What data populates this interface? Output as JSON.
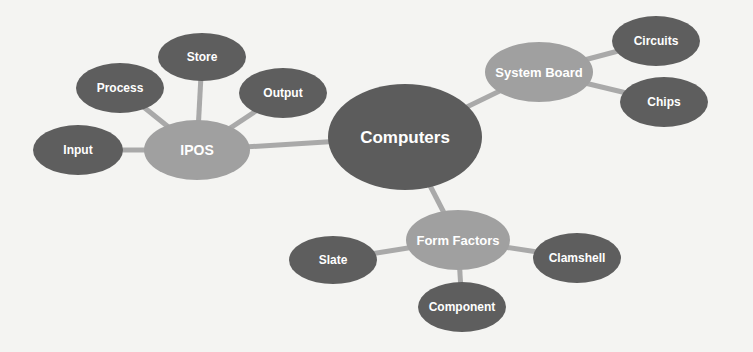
{
  "diagram": {
    "type": "mind-map",
    "colors": {
      "background": "#f4f4f2",
      "root_fill": "#5c5c5c",
      "branch_fill": "#a0a0a0",
      "leaf_fill": "#5e5e5e",
      "connector": "#a9a9a9",
      "label": "#ffffff"
    },
    "root": {
      "label": "Computers",
      "cx": 405,
      "cy": 137,
      "rx": 77,
      "ry": 53,
      "font_size": 17
    },
    "branches": [
      {
        "label": "IPOS",
        "cx": 197,
        "cy": 150,
        "rx": 53,
        "ry": 30,
        "font_size": 14,
        "children": [
          {
            "label": "Input",
            "cx": 78,
            "cy": 150,
            "rx": 45,
            "ry": 25
          },
          {
            "label": "Process",
            "cx": 120,
            "cy": 88,
            "rx": 44,
            "ry": 25
          },
          {
            "label": "Store",
            "cx": 202,
            "cy": 57,
            "rx": 44,
            "ry": 24
          },
          {
            "label": "Output",
            "cx": 283,
            "cy": 93,
            "rx": 44,
            "ry": 25
          }
        ]
      },
      {
        "label": "System Board",
        "cx": 539,
        "cy": 72,
        "rx": 54,
        "ry": 30,
        "font_size": 13,
        "children": [
          {
            "label": "Circuits",
            "cx": 656,
            "cy": 41,
            "rx": 44,
            "ry": 25
          },
          {
            "label": "Chips",
            "cx": 664,
            "cy": 102,
            "rx": 44,
            "ry": 25
          }
        ]
      },
      {
        "label": "Form Factors",
        "cx": 458,
        "cy": 240,
        "rx": 52,
        "ry": 30,
        "font_size": 13,
        "children": [
          {
            "label": "Slate",
            "cx": 333,
            "cy": 260,
            "rx": 44,
            "ry": 24
          },
          {
            "label": "Clamshell",
            "cx": 577,
            "cy": 258,
            "rx": 44,
            "ry": 25
          },
          {
            "label": "Component",
            "cx": 462,
            "cy": 307,
            "rx": 44,
            "ry": 25
          }
        ]
      }
    ]
  }
}
